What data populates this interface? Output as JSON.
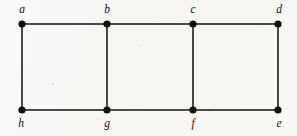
{
  "figure": {
    "kind": "undirected-graph",
    "background_color": "#f7f6f3",
    "ink_color": "#111111",
    "canvas": {
      "width": 297,
      "height": 136
    }
  },
  "chart_data": {
    "type": "diagram",
    "title": "",
    "node_count": 8,
    "edge_count": 10,
    "nodes": [
      {
        "id": "a",
        "label": "a",
        "x": 22,
        "y": 24,
        "label_x": 22,
        "label_y": 10,
        "label_position": "above"
      },
      {
        "id": "b",
        "label": "b",
        "x": 107,
        "y": 24,
        "label_x": 107,
        "label_y": 10,
        "label_position": "above"
      },
      {
        "id": "c",
        "label": "c",
        "x": 193,
        "y": 24,
        "label_x": 193,
        "label_y": 10,
        "label_position": "above"
      },
      {
        "id": "d",
        "label": "d",
        "x": 278,
        "y": 24,
        "label_x": 279,
        "label_y": 10,
        "label_position": "above"
      },
      {
        "id": "h",
        "label": "h",
        "x": 22,
        "y": 110,
        "label_x": 21,
        "label_y": 124,
        "label_position": "below"
      },
      {
        "id": "g",
        "label": "g",
        "x": 107,
        "y": 110,
        "label_x": 107,
        "label_y": 124,
        "label_position": "below"
      },
      {
        "id": "f",
        "label": "f",
        "x": 193,
        "y": 110,
        "label_x": 193,
        "label_y": 124,
        "label_position": "below"
      },
      {
        "id": "e",
        "label": "e",
        "x": 278,
        "y": 110,
        "label_x": 279,
        "label_y": 124,
        "label_position": "below"
      }
    ],
    "edges": [
      {
        "from": "a",
        "to": "b"
      },
      {
        "from": "b",
        "to": "c"
      },
      {
        "from": "c",
        "to": "d"
      },
      {
        "from": "h",
        "to": "g"
      },
      {
        "from": "g",
        "to": "f"
      },
      {
        "from": "f",
        "to": "e"
      },
      {
        "from": "a",
        "to": "h"
      },
      {
        "from": "b",
        "to": "g"
      },
      {
        "from": "c",
        "to": "f"
      },
      {
        "from": "d",
        "to": "e"
      }
    ],
    "node_radius": 3.6,
    "edge_width": 1.55
  }
}
